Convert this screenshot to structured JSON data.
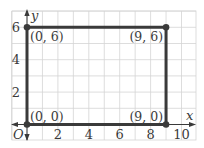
{
  "chart_data": {
    "type": "scatter",
    "title": "",
    "xlabel": "x",
    "ylabel": "y",
    "origin_label": "O",
    "xlim": [
      -1,
      11
    ],
    "ylim": [
      -1,
      7
    ],
    "grid": true,
    "x_ticks": [
      2,
      4,
      6,
      8,
      10
    ],
    "x_tick_labels": [
      "2",
      "4",
      "6",
      "8",
      "10"
    ],
    "y_ticks": [
      2,
      4,
      6
    ],
    "y_tick_labels": [
      "2",
      "4",
      "6"
    ],
    "points": [
      {
        "x": 0,
        "y": 0,
        "label": "(0, 0)"
      },
      {
        "x": 9,
        "y": 0,
        "label": "(9, 0)"
      },
      {
        "x": 9,
        "y": 6,
        "label": "(9, 6)"
      },
      {
        "x": 0,
        "y": 6,
        "label": "(0, 6)"
      }
    ],
    "polygon": "rectangle",
    "legend": null
  },
  "colors": {
    "grid": "#d4d4d4",
    "axis": "#3a3a3a",
    "shape": "#3a3a3a",
    "text": "#3a3a3a"
  }
}
